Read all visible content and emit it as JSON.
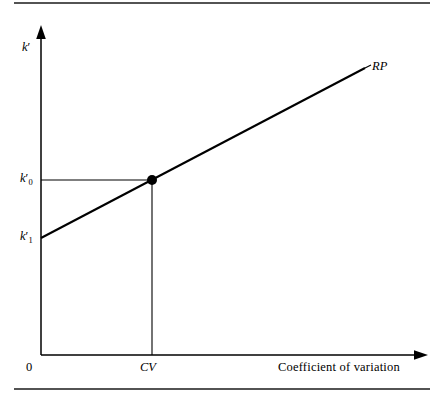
{
  "figure": {
    "type": "line-diagram",
    "background_color": "#ffffff",
    "ink_color": "#000000",
    "rule_color": "#1a1a1a",
    "width": 443,
    "height": 397,
    "top_rule": {
      "x1": 14,
      "x2": 430,
      "y": 3
    },
    "bottom_rule": {
      "x1": 14,
      "x2": 430,
      "y": 389
    }
  },
  "axes": {
    "origin": {
      "x": 41,
      "y": 355
    },
    "y_axis": {
      "x": 41,
      "y_top": 27,
      "y_bottom": 355,
      "arrow": "up"
    },
    "x_axis": {
      "y": 355,
      "x_left": 41,
      "x_right": 427,
      "arrow": "right"
    },
    "y_label": "k",
    "y_label_prime": "′",
    "x_label": "Coefficient of variation",
    "origin_label": "0"
  },
  "ticks": {
    "y": [
      {
        "id": "k0",
        "label_base": "k",
        "subscript": "0",
        "prime": "′",
        "y": 180
      },
      {
        "id": "k1",
        "label_base": "k",
        "subscript": "1",
        "prime": "′",
        "y": 238
      }
    ],
    "x": [
      {
        "id": "cv",
        "label": "CV",
        "x": 152
      }
    ]
  },
  "series": {
    "name": "RP",
    "label": "RP",
    "label_position": {
      "x": 372,
      "y": 68
    },
    "line": {
      "x1": 41,
      "y1": 238,
      "x2": 365,
      "y2": 68
    },
    "stroke_width": 2.1
  },
  "guides": [
    {
      "name": "horizontal-guide",
      "x1": 41,
      "y1": 180,
      "x2": 152,
      "y2": 180
    },
    {
      "name": "vertical-guide",
      "x1": 152,
      "y1": 180,
      "x2": 152,
      "y2": 355
    }
  ],
  "marker": {
    "name": "equilibrium-point",
    "x": 152,
    "y": 180,
    "radius": 5,
    "fill": "#000000"
  },
  "chart_data": {
    "type": "line",
    "title": "",
    "xlabel": "Coefficient of variation",
    "ylabel": "k′",
    "series": [
      {
        "name": "RP",
        "points": [
          {
            "x_label": "0",
            "y_label": "k′1"
          },
          {
            "x_label": "CV",
            "y_label": "k′0"
          }
        ]
      }
    ],
    "annotations": [
      "RP",
      "CV",
      "k′0",
      "k′1",
      "0"
    ],
    "grid": false,
    "legend": "none"
  }
}
